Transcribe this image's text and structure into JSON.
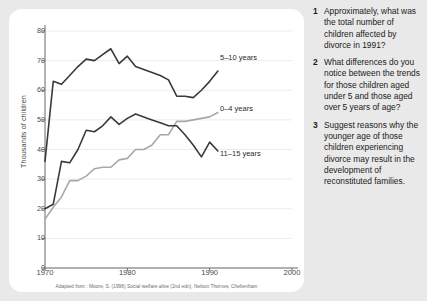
{
  "chart_data": {
    "type": "line",
    "title": "",
    "xlabel": "",
    "ylabel": "Thousands of children",
    "xlim": [
      1970,
      2000
    ],
    "ylim": [
      0,
      80
    ],
    "xticks": [
      "1970",
      "1980",
      "1990",
      "2000"
    ],
    "yticks": [
      "0",
      "10",
      "20",
      "30",
      "40",
      "50",
      "60",
      "70",
      "80"
    ],
    "grid": true,
    "legend_position": "inline-right",
    "caption": "Adapted from : Moore, S. (1996) Social welfare alive (2nd edn), Nelson Thornes, Cheltenham",
    "x": [
      1970,
      1971,
      1972,
      1973,
      1974,
      1975,
      1976,
      1977,
      1978,
      1979,
      1980,
      1981,
      1982,
      1983,
      1984,
      1985,
      1986,
      1987,
      1988,
      1989,
      1990,
      1991
    ],
    "series": [
      {
        "name": "5-10 years",
        "label": "5–10 years",
        "color": "#3a3a3a",
        "values": [
          36,
          63,
          62,
          65,
          68,
          70.5,
          70,
          72,
          74,
          69,
          71.5,
          68,
          67,
          66,
          65,
          63.5,
          58,
          58,
          57.5,
          60,
          63,
          66.5
        ]
      },
      {
        "name": "0-4 years",
        "label": "0–4 years",
        "color": "#a8a8a8",
        "values": [
          16.5,
          20.5,
          24,
          29.5,
          29.5,
          31,
          33.5,
          34,
          34,
          36.5,
          37,
          40,
          40,
          41.5,
          45,
          45,
          49.5,
          49.5,
          50,
          50.5,
          51,
          52.5
        ]
      },
      {
        "name": "11-15 years",
        "label": "11–15 years",
        "color": "#3a3a3a",
        "values": [
          20,
          21.5,
          36,
          35.5,
          40,
          46.5,
          46,
          48,
          51,
          48.5,
          50.5,
          52,
          51,
          50,
          49,
          48,
          48,
          45,
          41.5,
          37.5,
          42.5,
          39.5
        ]
      }
    ]
  },
  "questions": [
    {
      "number": "1",
      "text": "Approximately, what was the total number of children affected by divorce in 1991?"
    },
    {
      "number": "2",
      "text": "What differences do you notice between the trends for those children aged under 5 and those aged over 5 years of age?"
    },
    {
      "number": "3",
      "text": "Suggest reasons why the younger age of those children experiencing divorce may result in the development of reconstituted families."
    }
  ]
}
